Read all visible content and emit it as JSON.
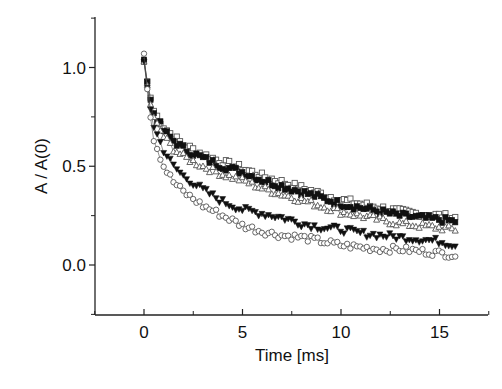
{
  "chart_data": {
    "type": "scatter",
    "title": "",
    "xlabel": "Time [ms]",
    "ylabel": "A / A(0)",
    "xlim": [
      -2.5,
      17.5
    ],
    "ylim": [
      -0.25,
      1.25
    ],
    "xticks": [
      0,
      5,
      10,
      15
    ],
    "xtick_labels": [
      "0",
      "5",
      "10",
      "15"
    ],
    "yticks": [
      0.0,
      0.5,
      1.0
    ],
    "ytick_labels": [
      "0.0",
      "0.5",
      "1.0"
    ],
    "grid": false,
    "legend": null,
    "series": [
      {
        "name": "open squares",
        "marker": "square-open",
        "x": [
          0,
          0.25,
          0.5,
          1,
          1.5,
          2,
          3,
          4,
          5,
          6,
          7,
          8,
          9,
          10,
          11,
          12,
          13,
          14,
          15,
          15.8
        ],
        "y": [
          1.03,
          0.88,
          0.78,
          0.7,
          0.65,
          0.61,
          0.56,
          0.52,
          0.49,
          0.45,
          0.42,
          0.39,
          0.36,
          0.33,
          0.31,
          0.29,
          0.27,
          0.26,
          0.25,
          0.24
        ]
      },
      {
        "name": "filled squares",
        "marker": "square-filled",
        "x": [
          0,
          0.25,
          0.5,
          1,
          1.5,
          2,
          3,
          4,
          5,
          6,
          7,
          8,
          9,
          10,
          11,
          12,
          13,
          14,
          15,
          15.8
        ],
        "y": [
          1.04,
          0.87,
          0.77,
          0.68,
          0.63,
          0.59,
          0.54,
          0.5,
          0.47,
          0.43,
          0.4,
          0.37,
          0.34,
          0.31,
          0.29,
          0.27,
          0.25,
          0.24,
          0.23,
          0.22
        ]
      },
      {
        "name": "open triangles",
        "marker": "triangle-open",
        "x": [
          0,
          0.25,
          0.5,
          1,
          1.5,
          2,
          3,
          4,
          5,
          6,
          7,
          8,
          9,
          10,
          11,
          12,
          13,
          14,
          15,
          15.8
        ],
        "y": [
          1.03,
          0.85,
          0.74,
          0.65,
          0.59,
          0.55,
          0.5,
          0.46,
          0.43,
          0.39,
          0.36,
          0.33,
          0.3,
          0.27,
          0.25,
          0.23,
          0.21,
          0.2,
          0.19,
          0.18
        ]
      },
      {
        "name": "filled down triangles",
        "marker": "triangle-down-filled",
        "x": [
          0,
          0.25,
          0.5,
          1,
          1.5,
          2,
          3,
          4,
          5,
          6,
          7,
          8,
          9,
          10,
          11,
          12,
          13,
          14,
          15,
          15.8
        ],
        "y": [
          1.03,
          0.83,
          0.7,
          0.58,
          0.5,
          0.45,
          0.38,
          0.32,
          0.28,
          0.26,
          0.24,
          0.21,
          0.19,
          0.18,
          0.16,
          0.15,
          0.14,
          0.13,
          0.12,
          0.1
        ]
      },
      {
        "name": "open circles",
        "marker": "circle-open",
        "x": [
          0,
          0.25,
          0.5,
          1,
          1.5,
          2,
          3,
          4,
          5,
          6,
          7,
          8,
          9,
          10,
          11,
          12,
          13,
          14,
          15,
          15.8
        ],
        "y": [
          1.07,
          0.8,
          0.64,
          0.5,
          0.42,
          0.37,
          0.3,
          0.25,
          0.2,
          0.17,
          0.15,
          0.14,
          0.12,
          0.1,
          0.09,
          0.08,
          0.08,
          0.07,
          0.06,
          0.05
        ]
      }
    ]
  }
}
